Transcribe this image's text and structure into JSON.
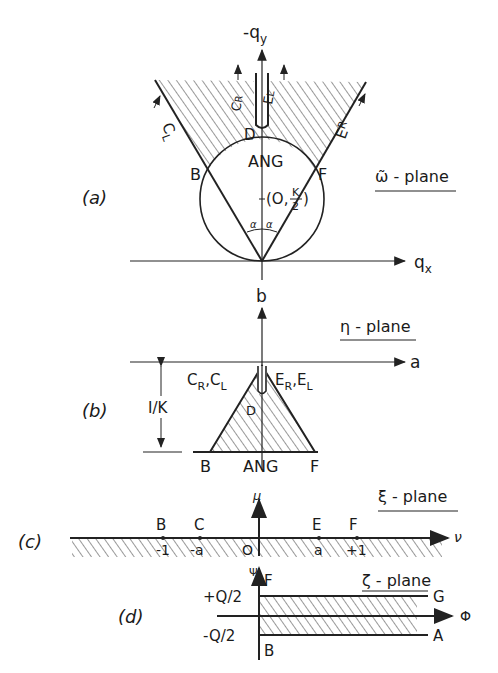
{
  "panels": {
    "a": {
      "tag": "(a)",
      "plane_label": "ω̃ - plane",
      "y_axis": "-q",
      "y_axis_sub": "y",
      "x_axis": "q",
      "x_axis_sub": "x",
      "region_label": "ANG",
      "center_label_pre": "(O,",
      "center_num": "K",
      "center_den": "2",
      "center_label_post": ")",
      "points": {
        "B": "B",
        "F": "F",
        "D": "D"
      },
      "edge_labels": {
        "CL": "C",
        "CL_sub": "L",
        "ER": "E",
        "ER_sub": "R",
        "CR": "C",
        "CR_sub": "R",
        "EL": "E",
        "EL_sub": "L"
      },
      "angle_label": "α"
    },
    "b": {
      "tag": "(b)",
      "plane_label": "η - plane",
      "y_axis": "b",
      "x_axis": "a",
      "height_label": "I/K",
      "left_top": "C",
      "left_top_sub1": "R",
      "left_top_mid": ",C",
      "left_top_sub2": "L",
      "right_top": "E",
      "right_top_sub1": "R",
      "right_top_mid": ",E",
      "right_top_sub2": "L",
      "point_D": "D",
      "bottom_left": "B",
      "bottom_mid": "ANG",
      "bottom_right": "F"
    },
    "c": {
      "tag": "(c)",
      "plane_label": "ξ - plane",
      "y_axis": "μ",
      "x_axis": "ν",
      "points": [
        {
          "name": "B",
          "value": "-1"
        },
        {
          "name": "C",
          "value": "-a"
        },
        {
          "name": "",
          "value": "O"
        },
        {
          "name": "E",
          "value": "a"
        },
        {
          "name": "F",
          "value": "+1"
        }
      ]
    },
    "d": {
      "tag": "(d)",
      "plane_label": "ζ - plane",
      "y_axis": "Ψ",
      "x_axis": "Φ",
      "top_label": "+Q/2",
      "bottom_label": "-Q/2",
      "top_point": "F",
      "bottom_point": "B",
      "upper_end": "G",
      "lower_end": "A"
    }
  }
}
